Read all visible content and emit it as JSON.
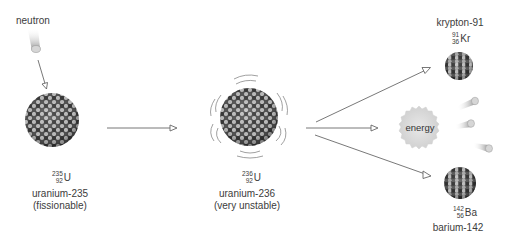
{
  "diagram": {
    "type": "nuclear-fission-process",
    "colors": {
      "arrow": "#555555",
      "nucleon_dark": "#3f3f3f",
      "nucleon_light": "#bdbdbd",
      "energy_fill": "#d9d9d9",
      "text": "#3c3c3c"
    },
    "incoming": {
      "label": "neutron"
    },
    "reactant": {
      "mass_number": "235",
      "atomic_number": "92",
      "symbol": "U",
      "name": "uranium-235",
      "note": "(fissionable)"
    },
    "intermediate": {
      "mass_number": "236",
      "atomic_number": "92",
      "symbol": "U",
      "name": "uranium-236",
      "note": "(very unstable)"
    },
    "products": {
      "krypton": {
        "name": "krypton-91",
        "mass_number": "91",
        "atomic_number": "36",
        "symbol": "Kr"
      },
      "energy": {
        "label": "energy"
      },
      "barium": {
        "mass_number": "142",
        "atomic_number": "56",
        "symbol": "Ba",
        "name": "barium-142"
      },
      "neutrons_released": 3
    }
  }
}
